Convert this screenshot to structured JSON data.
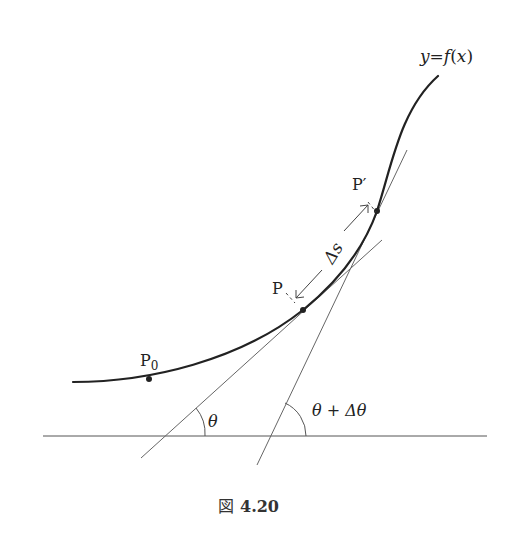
{
  "figure": {
    "caption_prefix": "図",
    "caption_number": "4.20",
    "curve_label": {
      "y": "y",
      "eq": "=",
      "f": "f",
      "lp": "(",
      "x": "x",
      "rp": ")"
    },
    "points": {
      "p0": {
        "label": "P",
        "sub": "0"
      },
      "p": {
        "label": "P"
      },
      "p_prime": {
        "label": "P′"
      }
    },
    "arc_label": "Δs",
    "angle1_label": "θ",
    "angle2_label": "θ + Δθ",
    "colors": {
      "curve": "#222222",
      "lines": "#444444",
      "background": "#ffffff"
    }
  }
}
